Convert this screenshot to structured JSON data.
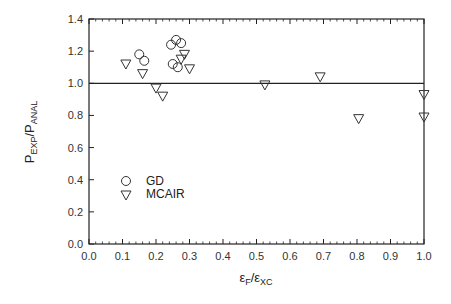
{
  "chart_data": {
    "type": "scatter",
    "title": "",
    "xlabel": "εF/εXC",
    "xlabel_parts": {
      "main1": "ε",
      "sub1": "F",
      "sep": "/ε",
      "sub2": "XC"
    },
    "ylabel": "PEXP/PANAL",
    "ylabel_parts": {
      "main1": "P",
      "sub1": "EXP",
      "sep": "/P",
      "sub2": "ANAL"
    },
    "xlim": [
      0.0,
      1.0
    ],
    "ylim": [
      0.0,
      1.4
    ],
    "x_ticks": [
      "0.0",
      "0.1",
      "0.2",
      "0.3",
      "0.4",
      "0.5",
      "0.6",
      "0.7",
      "0.8",
      "0.9",
      "1.0"
    ],
    "y_ticks": [
      "0.0",
      "0.2",
      "0.4",
      "0.6",
      "0.8",
      "1.0",
      "1.2",
      "1.4"
    ],
    "grid": false,
    "reference_line": {
      "y": 1.0
    },
    "legend_position": "lower-left inside",
    "series": [
      {
        "name": "GD",
        "marker": "circle-open",
        "x": [
          0.15,
          0.165,
          0.245,
          0.26,
          0.275,
          0.25,
          0.265
        ],
        "y": [
          1.18,
          1.14,
          1.24,
          1.27,
          1.25,
          1.12,
          1.1
        ]
      },
      {
        "name": "MCAIR",
        "marker": "triangle-down-open",
        "x": [
          0.11,
          0.16,
          0.2,
          0.22,
          0.285,
          0.275,
          0.3,
          0.525,
          0.69,
          0.805,
          1.0,
          1.0
        ],
        "y": [
          1.12,
          1.06,
          0.97,
          0.92,
          1.18,
          1.15,
          1.09,
          0.99,
          1.04,
          0.78,
          0.93,
          0.79
        ]
      }
    ]
  },
  "legend": {
    "items": [
      {
        "label": "GD"
      },
      {
        "label": "MCAIR"
      }
    ]
  },
  "colors": {
    "axis": "#222222",
    "marker": "#333333",
    "background": "#ffffff"
  }
}
